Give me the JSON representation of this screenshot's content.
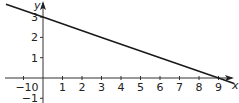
{
  "chart_data": {
    "type": "line",
    "title": "",
    "xlabel": "x",
    "ylabel": "y",
    "xlim": [
      -1.8,
      10
    ],
    "ylim": [
      -1.2,
      3.9
    ],
    "x_ticks": [
      -1,
      0,
      1,
      2,
      3,
      4,
      5,
      6,
      7,
      8,
      9
    ],
    "y_ticks": [
      -1,
      1,
      2,
      3
    ],
    "grid": false,
    "series": [
      {
        "name": "line",
        "equation": "y = 3 - x/3",
        "x": [
          -1.9,
          0,
          3,
          6,
          9,
          9.8
        ],
        "y": [
          3.63,
          3,
          2,
          1,
          0,
          -0.27
        ]
      }
    ],
    "annotations": []
  }
}
